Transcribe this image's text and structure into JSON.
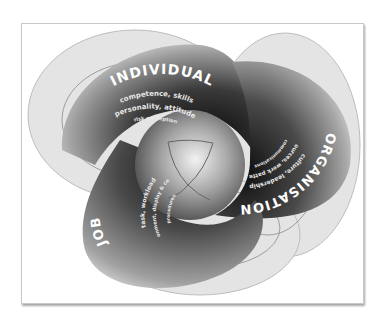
{
  "diagram": {
    "type": "three-ring interlocking model",
    "center_label": "",
    "rings": [
      {
        "id": "individual",
        "title": "INDIVIDUAL",
        "factors": [
          "competence, skills",
          "personality, attitude",
          "risk perception"
        ]
      },
      {
        "id": "organisation",
        "title": "ORGANISATION",
        "factors": [
          "culture, leadership",
          "resources, work patterns",
          "communications"
        ]
      },
      {
        "id": "job",
        "title": "JOB",
        "factors": [
          "task, workload",
          "environment, display & controls",
          "procedures"
        ]
      }
    ],
    "colors": {
      "background": "#ffffff",
      "frame_border": "#c8c8c8",
      "ring_dark": "#1a1a1a",
      "ring_mid": "#7a7a7a",
      "ring_light": "#d9d9d9",
      "text": "#ffffff"
    }
  }
}
